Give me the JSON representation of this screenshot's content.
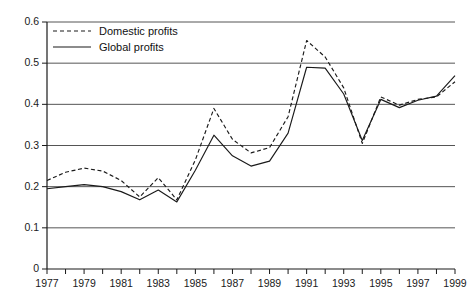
{
  "chart_data": {
    "type": "line",
    "title": "",
    "subtitle": "",
    "xlabel": "",
    "ylabel": "",
    "grid": true,
    "legend_position": "top-left",
    "x": [
      1977,
      1978,
      1979,
      1980,
      1981,
      1982,
      1983,
      1984,
      1985,
      1986,
      1987,
      1988,
      1989,
      1990,
      1991,
      1992,
      1993,
      1994,
      1995,
      1996,
      1997,
      1998,
      1999
    ],
    "xlim": [
      1977,
      1999
    ],
    "ylim": [
      0,
      0.6
    ],
    "ytick_labels": [
      "0",
      "0.1",
      "0.2",
      "0.3",
      "0.4",
      "0.5",
      "0.6"
    ],
    "ytick_values": [
      0,
      0.1,
      0.2,
      0.3,
      0.4,
      0.5,
      0.6
    ],
    "xtick_labels": [
      "1977",
      "1979",
      "1981",
      "1983",
      "1985",
      "1987",
      "1989",
      "1991",
      "1993",
      "1995",
      "1997",
      "1999"
    ],
    "xtick_values": [
      1977,
      1979,
      1981,
      1983,
      1985,
      1987,
      1989,
      1991,
      1993,
      1995,
      1997,
      1999
    ],
    "xminor_values": [
      1978,
      1980,
      1982,
      1984,
      1986,
      1988,
      1990,
      1992,
      1994,
      1996,
      1998
    ],
    "series": [
      {
        "name": "Domestic profits",
        "style": "dashed",
        "color": "#1a1a1a",
        "values": [
          0.215,
          0.235,
          0.245,
          0.238,
          0.215,
          0.175,
          0.222,
          0.168,
          0.265,
          0.39,
          0.315,
          0.282,
          0.295,
          0.37,
          0.555,
          0.515,
          0.44,
          0.305,
          0.418,
          0.398,
          0.412,
          0.418,
          0.455
        ]
      },
      {
        "name": "Global profits",
        "style": "solid",
        "color": "#1a1a1a",
        "values": [
          0.195,
          0.2,
          0.205,
          0.2,
          0.188,
          0.168,
          0.192,
          0.163,
          0.24,
          0.325,
          0.275,
          0.25,
          0.262,
          0.33,
          0.49,
          0.488,
          0.425,
          0.312,
          0.412,
          0.392,
          0.41,
          0.42,
          0.47
        ]
      }
    ]
  },
  "legend": {
    "items": [
      {
        "label": "Domestic profits",
        "style": "dashed"
      },
      {
        "label": "Global profits",
        "style": "solid"
      }
    ]
  }
}
